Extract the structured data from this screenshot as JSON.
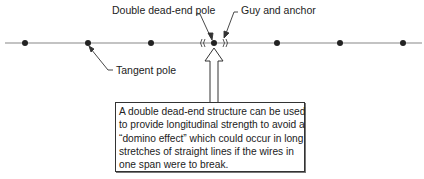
{
  "labels": {
    "double_dead_end": "Double dead-end pole",
    "guy_anchor": "Guy and anchor",
    "tangent": "Tangent pole"
  },
  "note": {
    "lines": [
      "A double dead-end structure can be used",
      "to provide longitudinal strength to avoid a",
      "“domino effect” which could occur in long",
      "stretches of straight lines if the wires in",
      "one span were to break."
    ]
  },
  "diagram": {
    "line_y": 43,
    "poles_x": [
      25,
      88,
      151,
      214,
      277,
      340,
      403
    ],
    "dead_end_pole_x": 214,
    "colors": {
      "line": "#888888",
      "pole": "#222222",
      "ink": "#222222"
    }
  }
}
